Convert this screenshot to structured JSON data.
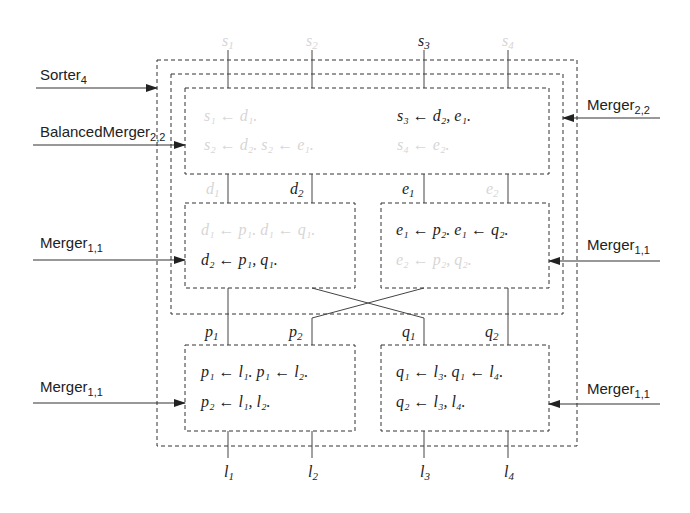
{
  "diagram": {
    "type": "nested module dataflow diagram",
    "modules": {
      "outer": {
        "name": "Sorter",
        "subscript": "4"
      },
      "balanced": {
        "name": "BalancedMerger",
        "subscript": "2,2"
      },
      "top_merger": {
        "name": "Merger",
        "subscript": "2,2"
      },
      "mid_left": {
        "name": "Merger",
        "subscript": "1,1"
      },
      "mid_right": {
        "name": "Merger",
        "subscript": "1,1"
      },
      "bottom_left": {
        "name": "Merger",
        "subscript": "1,1"
      },
      "bottom_right": {
        "name": "Merger",
        "subscript": "1,1"
      }
    },
    "top_outputs": [
      {
        "base": "s",
        "sub": "1",
        "faded": true
      },
      {
        "base": "s",
        "sub": "2",
        "faded": true
      },
      {
        "base": "s",
        "sub": "3",
        "faded": false
      },
      {
        "base": "s",
        "sub": "4",
        "faded": true
      }
    ],
    "bottom_inputs": [
      {
        "base": "l",
        "sub": "1"
      },
      {
        "base": "l",
        "sub": "2"
      },
      {
        "base": "l",
        "sub": "3"
      },
      {
        "base": "l",
        "sub": "4"
      }
    ],
    "mid_wires": [
      {
        "base": "d",
        "sub": "1",
        "faded": true
      },
      {
        "base": "d",
        "sub": "2",
        "faded": false
      },
      {
        "base": "e",
        "sub": "1",
        "faded": false
      },
      {
        "base": "e",
        "sub": "2",
        "faded": true
      }
    ],
    "low_wires": [
      {
        "base": "p",
        "sub": "1"
      },
      {
        "base": "p",
        "sub": "2"
      },
      {
        "base": "q",
        "sub": "1"
      },
      {
        "base": "q",
        "sub": "2"
      }
    ],
    "rules": {
      "top_left_1": "s₁ ← d₁.",
      "top_left_2": "s₂ ← d₂. s₂ ← e₁.",
      "top_right_1": "s₃ ← d₂, e₁.",
      "top_right_2": "s₄ ← e₂.",
      "mid_left_1": "d₁ ← p₁. d₁ ← q₁.",
      "mid_left_2": "d₂ ← p₁, q₁.",
      "mid_right_1": "e₁ ← p₂. e₁ ← q₂.",
      "mid_right_2": "e₂ ← p₂, q₂.",
      "bottom_left_1": "p₁ ← l₁. p₁ ← l₂.",
      "bottom_left_2": "p₂ ← l₁, l₂.",
      "bottom_right_1": "q₁ ← l₃. q₁ ← l₄.",
      "bottom_right_2": "q₂ ← l₃, l₄."
    },
    "faded_rules": [
      "top_left_1",
      "top_left_2",
      "top_right_2",
      "mid_left_1",
      "mid_right_2"
    ]
  }
}
